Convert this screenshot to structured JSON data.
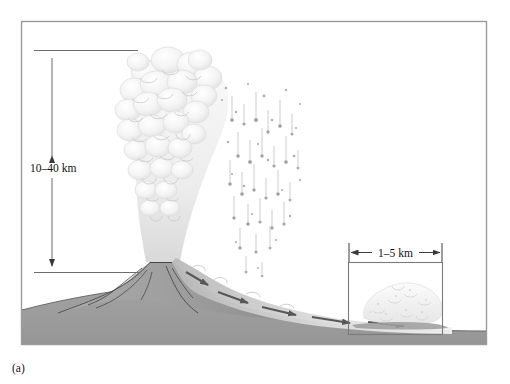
{
  "figure": {
    "panel_label": "(a)",
    "border_color": "#9b9b9b",
    "background_color": "#ffffff"
  },
  "annotations": {
    "column_height": {
      "label": "10–40 km",
      "orientation": "vertical",
      "arrow_style": "double-headed",
      "text_color": "#111111",
      "line_color": "#6d6d6d"
    },
    "flow_width": {
      "label": "1–5 km",
      "orientation": "horizontal",
      "arrow_style": "double-headed",
      "text_color": "#111111",
      "line_color": "#3a3a3a"
    }
  },
  "scene": {
    "ground_color": "#9c9c9c",
    "ground_shadow_color": "#8a8a8a",
    "volcano_color": "#a3a3a3",
    "volcano_outline_color": "#3c3c3c",
    "plume_color": "#f0f0f0",
    "plume_edge_color": "#d8d8d8",
    "ash_fall_color": "#b9b9b9",
    "flow_arrow_color": "#5e5e5e",
    "flow_cloud_color": "#ededed",
    "vent_streak_color": "#4a4a4a",
    "inset_box_color": "#7b7b7b"
  },
  "elements": {
    "eruption_column": "eruption-column",
    "ash_fall": "ash-fall",
    "volcano_cone": "volcano-cone",
    "pyroclastic_flow": "pyroclastic-flow",
    "pyroclastic_cloud": "pyroclastic-cloud",
    "ground_surface": "ground-surface",
    "inset_box": "inset-box"
  }
}
